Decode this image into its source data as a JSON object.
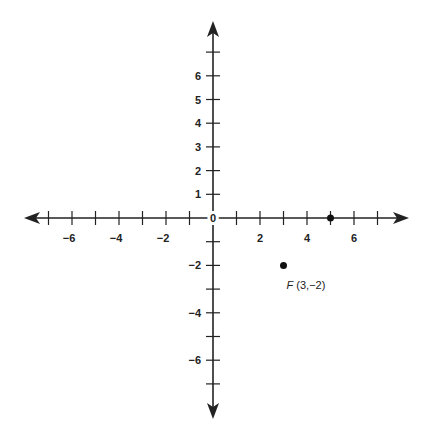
{
  "chart_data": {
    "type": "scatter",
    "title": "",
    "xlabel": "",
    "ylabel": "",
    "xlim": [
      -7.5,
      8.3
    ],
    "ylim": [
      -8.5,
      8.3
    ],
    "grid": false,
    "x_ticks": [
      -7,
      -6,
      -5,
      -4,
      -3,
      -2,
      -1,
      1,
      2,
      3,
      4,
      5,
      6,
      7
    ],
    "x_tick_labels": [
      {
        "value": -6,
        "text": "−6"
      },
      {
        "value": -4,
        "text": "−4"
      },
      {
        "value": -2,
        "text": "−2"
      },
      {
        "value": 2,
        "text": "2"
      },
      {
        "value": 4,
        "text": "4"
      },
      {
        "value": 6,
        "text": "6"
      }
    ],
    "y_ticks": [
      7,
      6,
      5,
      4,
      3,
      2,
      1,
      -1,
      -2,
      -3,
      -4,
      -5,
      -6,
      -7
    ],
    "y_tick_labels": [
      {
        "value": 6,
        "text": "6"
      },
      {
        "value": 5,
        "text": "5"
      },
      {
        "value": 4,
        "text": "4"
      },
      {
        "value": 3,
        "text": "3"
      },
      {
        "value": 2,
        "text": "2"
      },
      {
        "value": 1,
        "text": "1"
      },
      {
        "value": -2,
        "text": "−2"
      },
      {
        "value": -4,
        "text": "−4"
      },
      {
        "value": -6,
        "text": "−6"
      }
    ],
    "origin_label": "0",
    "points": [
      {
        "x": 5,
        "y": 0,
        "label": ""
      },
      {
        "x": 3,
        "y": -2,
        "label_name": "F",
        "label_coords": "(3,−2)"
      }
    ]
  },
  "colors": {
    "axis": "#222222",
    "point": "#111111"
  }
}
